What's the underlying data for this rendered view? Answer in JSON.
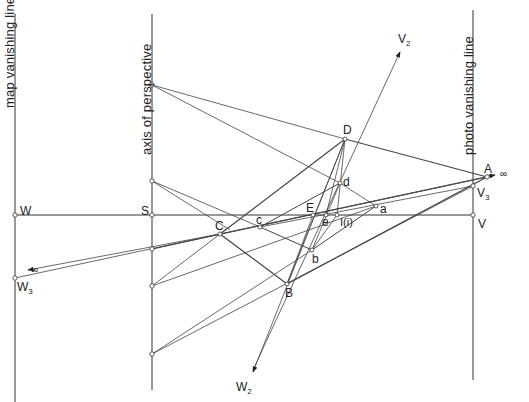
{
  "diagram": {
    "type": "perspective-geometry",
    "vertical_lines": [
      {
        "id": "map_vanishing_line",
        "label": "map  vanishing line",
        "x": 15
      },
      {
        "id": "axis_of_perspective",
        "label": "axis of perspective",
        "x": 152
      },
      {
        "id": "photo_vanishing_line",
        "label": "photo  vanishing line",
        "x": 473
      }
    ],
    "points": {
      "W": {
        "label": "W"
      },
      "S": {
        "label": "S"
      },
      "V": {
        "label": "V"
      },
      "A": {
        "label": "A"
      },
      "V3": {
        "label": "V",
        "sub": "3"
      },
      "W3": {
        "label": "W",
        "sub": "3"
      },
      "V2": {
        "label": "V",
        "sub": "2"
      },
      "W2": {
        "label": "W",
        "sub": "2"
      },
      "D": {
        "label": "D"
      },
      "d": {
        "label": "d"
      },
      "a": {
        "label": "a"
      },
      "E": {
        "label": "E"
      },
      "e": {
        "label": "e"
      },
      "I": {
        "label": "I(i)"
      },
      "c": {
        "label": "c"
      },
      "C": {
        "label": "C"
      },
      "b": {
        "label": "b"
      },
      "B": {
        "label": "B"
      }
    },
    "infinity_symbol": "∞"
  }
}
